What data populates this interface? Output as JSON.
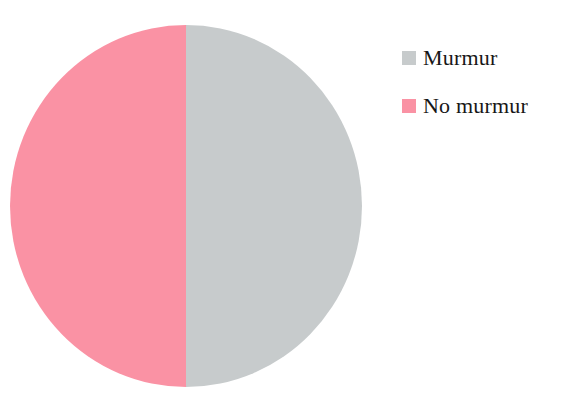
{
  "figure": {
    "background_color": "#ffffff",
    "text_color": "#171717"
  },
  "legend": {
    "position": "right",
    "items": [
      {
        "label": "Murmur",
        "color": "#c7cbcc",
        "swatch_name": "legend-swatch-murmur"
      },
      {
        "label": "No murmur",
        "color": "#fa92a4",
        "swatch_name": "legend-swatch-no-murmur"
      }
    ]
  },
  "chart_data": {
    "type": "pie",
    "title": "",
    "subtitle": "",
    "xlabel": "",
    "ylabel": "",
    "grid": false,
    "legend_position": "right",
    "labels": [
      "Murmur",
      "No murmur"
    ],
    "values": [
      50,
      50
    ],
    "percentages": [
      "50%",
      "50%"
    ],
    "colors": [
      "#c7cbcc",
      "#fa92a4"
    ],
    "start_angle_deg": 90,
    "direction": "counterclockwise",
    "slice_labels_shown": false,
    "annotations": []
  }
}
